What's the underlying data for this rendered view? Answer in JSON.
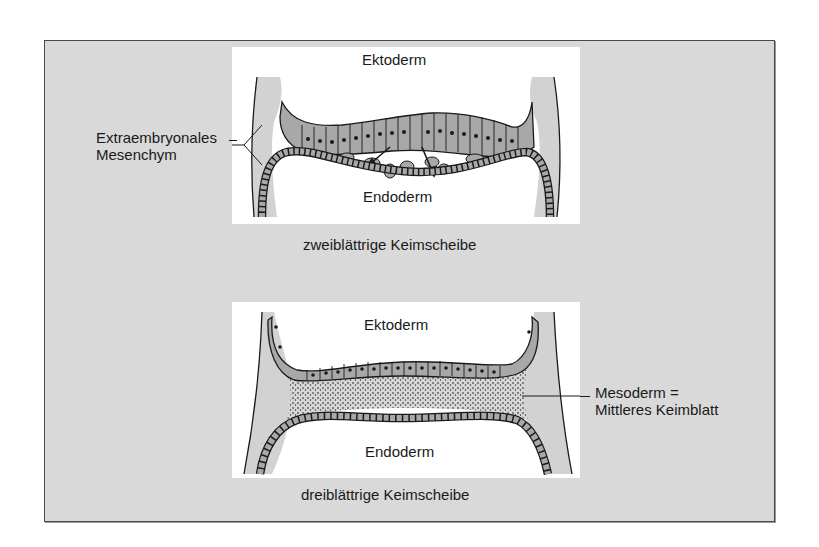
{
  "figure": {
    "diagram_top": {
      "caption": "zweiblättrige Keimscheibe",
      "labels": {
        "ectoderm": "Ektoderm",
        "endoderm": "Endoderm",
        "side_label_line1": "Extraembryonales",
        "side_label_line2": "Mesenchym"
      }
    },
    "diagram_bottom": {
      "caption": "dreiblättrige Keimscheibe",
      "labels": {
        "ectoderm": "Ektoderm",
        "endoderm": "Endoderm",
        "side_label_line1": "Mesoderm =",
        "side_label_line2": "Mittleres Keimblatt"
      }
    },
    "colors": {
      "frame_background": "#d9d9d9",
      "panel_background": "#ffffff",
      "cell_fill": "#a8a8a8",
      "mesenchyme_fill": "#d2d2d2",
      "outline": "#1a1a1a"
    }
  }
}
